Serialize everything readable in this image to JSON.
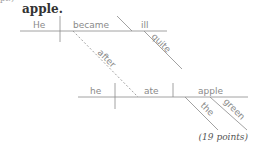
{
  "header": {
    "fragment": "pt.)",
    "sentence_end": "apple."
  },
  "diagram": {
    "main_clause": {
      "subject": "He",
      "verb": "became",
      "complement": "ill",
      "complement_modifier": "quite"
    },
    "connector": "after",
    "sub_clause": {
      "subject": "he",
      "verb": "ate",
      "object": "apple",
      "object_modifiers": [
        "the",
        "green"
      ]
    },
    "line_color": "#8a8a8a"
  },
  "footer": {
    "points": "(19 points)"
  }
}
